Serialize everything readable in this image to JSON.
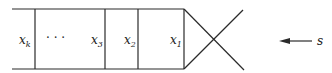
{
  "diagram": {
    "cells": [
      {
        "label": "x",
        "sub": "k"
      },
      {
        "label": "· · ·",
        "sub": ""
      },
      {
        "label": "x",
        "sub": "3"
      },
      {
        "label": "x",
        "sub": "2"
      },
      {
        "label": "x",
        "sub": "1"
      }
    ],
    "arrow_label": "s",
    "colors": {
      "line": "#2a2a2a",
      "text": "#222222",
      "background": "#ffffff"
    }
  }
}
